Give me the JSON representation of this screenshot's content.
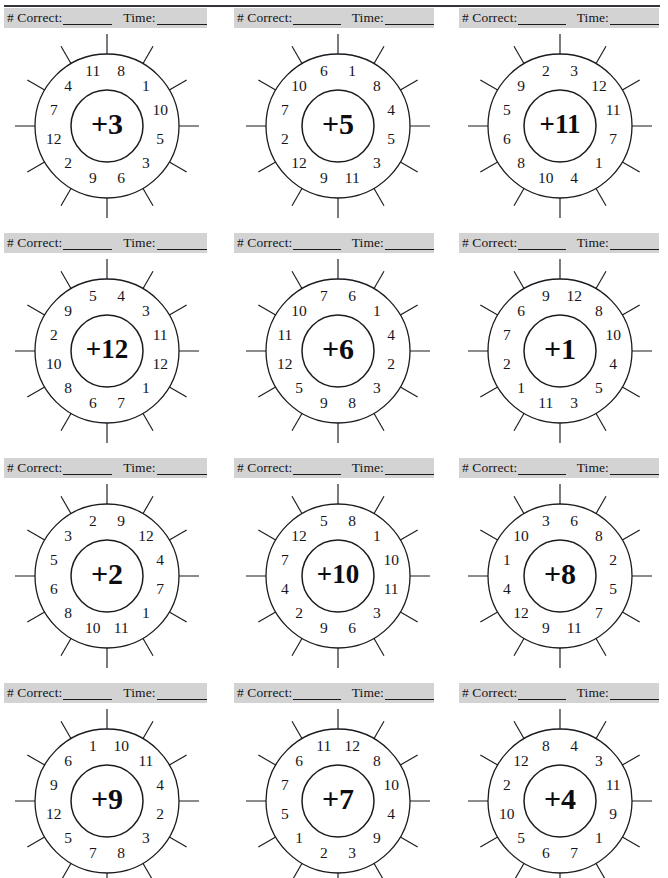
{
  "worksheet": {
    "title": "Addition Wheels",
    "score_label": "# Correct:",
    "time_label": "Time:",
    "top_rule": true
  },
  "chart_data": {
    "type": "table",
    "layout": {
      "rows": 4,
      "cols": 3,
      "sectors_per_wheel": 12
    },
    "note": "Each wheel: center operator plus outer-ring addends read clockwise starting from the sector just right of the top spoke.",
    "wheels": [
      {
        "index": 1,
        "center": "+3",
        "operator": "+",
        "addend": 3,
        "numbers": [
          8,
          1,
          10,
          5,
          3,
          6,
          9,
          2,
          12,
          7,
          4,
          11
        ]
      },
      {
        "index": 2,
        "center": "+5",
        "operator": "+",
        "addend": 5,
        "numbers": [
          1,
          8,
          4,
          5,
          3,
          11,
          9,
          12,
          2,
          7,
          10,
          6
        ]
      },
      {
        "index": 3,
        "center": "+11",
        "operator": "+",
        "addend": 11,
        "numbers": [
          3,
          12,
          11,
          7,
          1,
          4,
          10,
          8,
          6,
          5,
          9,
          2
        ]
      },
      {
        "index": 4,
        "center": "+12",
        "operator": "+",
        "addend": 12,
        "numbers": [
          4,
          3,
          11,
          12,
          1,
          7,
          6,
          8,
          10,
          2,
          9,
          5
        ]
      },
      {
        "index": 5,
        "center": "+6",
        "operator": "+",
        "addend": 6,
        "numbers": [
          6,
          1,
          4,
          2,
          3,
          8,
          9,
          5,
          12,
          11,
          10,
          7
        ]
      },
      {
        "index": 6,
        "center": "+1",
        "operator": "+",
        "addend": 1,
        "numbers": [
          12,
          8,
          10,
          4,
          5,
          3,
          11,
          1,
          2,
          7,
          6,
          9
        ]
      },
      {
        "index": 7,
        "center": "+2",
        "operator": "+",
        "addend": 2,
        "numbers": [
          9,
          12,
          4,
          7,
          1,
          11,
          10,
          8,
          6,
          5,
          3,
          2
        ]
      },
      {
        "index": 8,
        "center": "+10",
        "operator": "+",
        "addend": 10,
        "numbers": [
          8,
          1,
          10,
          11,
          3,
          6,
          9,
          2,
          4,
          7,
          12,
          5
        ]
      },
      {
        "index": 9,
        "center": "+8",
        "operator": "+",
        "addend": 8,
        "numbers": [
          6,
          8,
          2,
          5,
          7,
          11,
          9,
          12,
          4,
          1,
          10,
          3
        ]
      },
      {
        "index": 10,
        "center": "+9",
        "operator": "+",
        "addend": 9,
        "numbers": [
          10,
          11,
          4,
          2,
          3,
          8,
          7,
          5,
          12,
          9,
          6,
          1
        ]
      },
      {
        "index": 11,
        "center": "+7",
        "operator": "+",
        "addend": 7,
        "numbers": [
          12,
          8,
          10,
          4,
          9,
          3,
          2,
          1,
          5,
          7,
          6,
          11
        ]
      },
      {
        "index": 12,
        "center": "+4",
        "operator": "+",
        "addend": 4,
        "numbers": [
          4,
          3,
          11,
          9,
          1,
          7,
          6,
          5,
          10,
          2,
          12,
          8
        ]
      }
    ],
    "colors": {
      "ink": "#1b1a20",
      "band": "#d3d3d3",
      "paper": "#ffffff"
    }
  }
}
